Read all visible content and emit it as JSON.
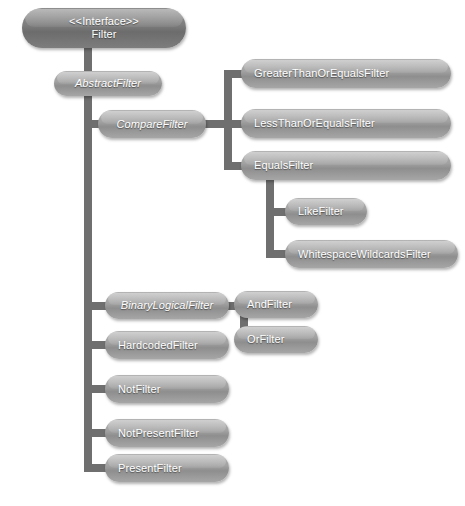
{
  "diagram": {
    "width": 465,
    "height": 506,
    "background_color": "#ffffff",
    "node_color": "#a2a2a2",
    "root_node_color": "#7e7e7e",
    "connector_color": "#6f6f6f",
    "label_color": "#ffffff"
  },
  "nodes": {
    "filter_interface": {
      "stereotype": "<<Interface>>",
      "name": "Filter",
      "abstract": false,
      "is_interface": true
    },
    "abstract_filter": {
      "name": "AbstractFilter",
      "abstract": true
    },
    "compare_filter": {
      "name": "CompareFilter",
      "abstract": true
    },
    "greater_than_or_equals_filter": {
      "name": "GreaterThanOrEqualsFilter",
      "abstract": false
    },
    "less_than_or_equals_filter": {
      "name": "LessThanOrEqualsFilter",
      "abstract": false
    },
    "equals_filter": {
      "name": "EqualsFilter",
      "abstract": false
    },
    "like_filter": {
      "name": "LikeFilter",
      "abstract": false
    },
    "whitespace_wildcards_filter": {
      "name": "WhitespaceWildcardsFilter",
      "abstract": false
    },
    "binary_logical_filter": {
      "name": "BinaryLogicalFilter",
      "abstract": true
    },
    "and_filter": {
      "name": "AndFilter",
      "abstract": false
    },
    "or_filter": {
      "name": "OrFilter",
      "abstract": false
    },
    "hardcoded_filter": {
      "name": "HardcodedFilter",
      "abstract": false
    },
    "not_filter": {
      "name": "NotFilter",
      "abstract": false
    },
    "not_present_filter": {
      "name": "NotPresentFilter",
      "abstract": false
    },
    "present_filter": {
      "name": "PresentFilter",
      "abstract": false
    }
  },
  "hierarchy": [
    {
      "parent": "Filter",
      "child": "AbstractFilter"
    },
    {
      "parent": "AbstractFilter",
      "child": "CompareFilter"
    },
    {
      "parent": "AbstractFilter",
      "child": "BinaryLogicalFilter"
    },
    {
      "parent": "AbstractFilter",
      "child": "HardcodedFilter"
    },
    {
      "parent": "AbstractFilter",
      "child": "NotFilter"
    },
    {
      "parent": "AbstractFilter",
      "child": "NotPresentFilter"
    },
    {
      "parent": "AbstractFilter",
      "child": "PresentFilter"
    },
    {
      "parent": "CompareFilter",
      "child": "GreaterThanOrEqualsFilter"
    },
    {
      "parent": "CompareFilter",
      "child": "LessThanOrEqualsFilter"
    },
    {
      "parent": "CompareFilter",
      "child": "EqualsFilter"
    },
    {
      "parent": "EqualsFilter",
      "child": "LikeFilter"
    },
    {
      "parent": "EqualsFilter",
      "child": "WhitespaceWildcardsFilter"
    },
    {
      "parent": "BinaryLogicalFilter",
      "child": "AndFilter"
    },
    {
      "parent": "BinaryLogicalFilter",
      "child": "OrFilter"
    }
  ]
}
